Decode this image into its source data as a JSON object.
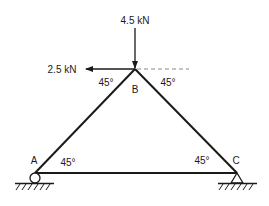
{
  "diagram": {
    "nodes": {
      "A": {
        "label": "A",
        "support": "roller"
      },
      "B": {
        "label": "B"
      },
      "C": {
        "label": "C",
        "support": "pin"
      }
    },
    "members": [
      "AB",
      "BC",
      "AC"
    ],
    "loads": {
      "vertical": {
        "label": "4.5 kN",
        "direction": "down",
        "at": "B"
      },
      "horizontal": {
        "label": "2.5 kN",
        "direction": "left",
        "at": "B"
      }
    },
    "angles": {
      "B_left": "45°",
      "B_right": "45°",
      "A": "45°",
      "C": "45°"
    },
    "colors": {
      "line": "#1a1a1a",
      "dashed": "#888888",
      "background": "#ffffff"
    }
  }
}
